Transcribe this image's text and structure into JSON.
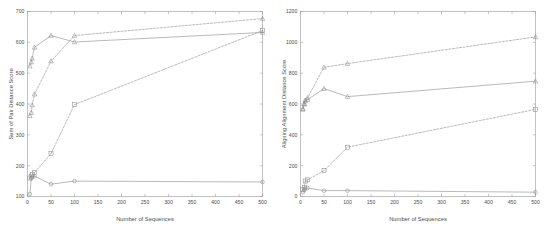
{
  "figure": {
    "background_color": "#ffffff",
    "line_color": "#8f8f8f",
    "axis_color": "#9a9a9a",
    "text_color": "#4d4d4d"
  },
  "panels": [
    {
      "id": "left",
      "xlabel": "Number of Sequences",
      "ylabel": "Sum of Pair Distance Score",
      "xticks": [
        "0",
        "50",
        "100",
        "150",
        "200",
        "250",
        "300",
        "350",
        "400",
        "450",
        "500"
      ],
      "yticks": [
        "100",
        "200",
        "300",
        "400",
        "500",
        "600",
        "700"
      ]
    },
    {
      "id": "right",
      "xlabel": "Number of Sequences",
      "ylabel": "Aligning Alignment Distance Score",
      "xticks": [
        "0",
        "50",
        "100",
        "150",
        "200",
        "250",
        "300",
        "350",
        "400",
        "450",
        "500"
      ],
      "yticks": [
        "0",
        "200",
        "400",
        "600",
        "800",
        "1000",
        "1200"
      ]
    }
  ],
  "chart_data": [
    {
      "type": "line",
      "panel": "left",
      "title": "",
      "xlabel": "Number of Sequences",
      "ylabel": "Sum of Pair Distance Score",
      "xlim": [
        0,
        500
      ],
      "ylim": [
        100,
        700
      ],
      "xticks": [
        0,
        50,
        100,
        150,
        200,
        250,
        300,
        350,
        400,
        450,
        500
      ],
      "yticks": [
        100,
        200,
        300,
        400,
        500,
        600,
        700
      ],
      "grid": false,
      "legend": "none",
      "series": [
        {
          "name": "solid-triangle-upper",
          "linestyle": "solid",
          "marker": "triangle",
          "x": [
            5,
            8,
            10,
            15,
            50,
            100,
            500
          ],
          "y": [
            523,
            536,
            548,
            584,
            622,
            601,
            632
          ]
        },
        {
          "name": "dashed-triangle",
          "linestyle": "dashed",
          "marker": "triangle",
          "x": [
            5,
            8,
            10,
            15,
            50,
            100,
            500
          ],
          "y": [
            362,
            372,
            397,
            432,
            539,
            622,
            677
          ]
        },
        {
          "name": "dashed-square",
          "linestyle": "dashed",
          "marker": "square",
          "x": [
            5,
            8,
            10,
            15,
            50,
            100,
            500
          ],
          "y": [
            160,
            166,
            172,
            178,
            239,
            398,
            638
          ]
        },
        {
          "name": "solid-circle-lower",
          "linestyle": "solid",
          "marker": "circle",
          "x": [
            5,
            8,
            10,
            15,
            50,
            100,
            500
          ],
          "y": [
            108,
            158,
            163,
            166,
            140,
            150,
            147
          ]
        }
      ]
    },
    {
      "type": "line",
      "panel": "right",
      "title": "",
      "xlabel": "Number of Sequences",
      "ylabel": "Aligning Alignment Distance Score",
      "xlim": [
        0,
        500
      ],
      "ylim": [
        0,
        1200
      ],
      "xticks": [
        0,
        50,
        100,
        150,
        200,
        250,
        300,
        350,
        400,
        450,
        500
      ],
      "yticks": [
        0,
        200,
        400,
        600,
        800,
        1000,
        1200
      ],
      "grid": false,
      "legend": "none",
      "series": [
        {
          "name": "dashed-triangle-upper",
          "linestyle": "dashed",
          "marker": "triangle",
          "x": [
            5,
            8,
            10,
            15,
            50,
            100,
            500
          ],
          "y": [
            570,
            600,
            625,
            640,
            838,
            862,
            1035
          ]
        },
        {
          "name": "solid-triangle",
          "linestyle": "solid",
          "marker": "triangle",
          "x": [
            5,
            8,
            10,
            15,
            50,
            100,
            500
          ],
          "y": [
            565,
            600,
            618,
            628,
            700,
            648,
            748
          ]
        },
        {
          "name": "dashed-square",
          "linestyle": "dashed",
          "marker": "square",
          "x": [
            5,
            8,
            10,
            15,
            50,
            100,
            500
          ],
          "y": [
            45,
            60,
            100,
            108,
            168,
            320,
            565
          ]
        },
        {
          "name": "solid-circle-lower",
          "linestyle": "solid",
          "marker": "circle",
          "x": [
            5,
            8,
            10,
            15,
            50,
            100,
            500
          ],
          "y": [
            28,
            40,
            52,
            55,
            38,
            38,
            28
          ]
        }
      ]
    }
  ]
}
